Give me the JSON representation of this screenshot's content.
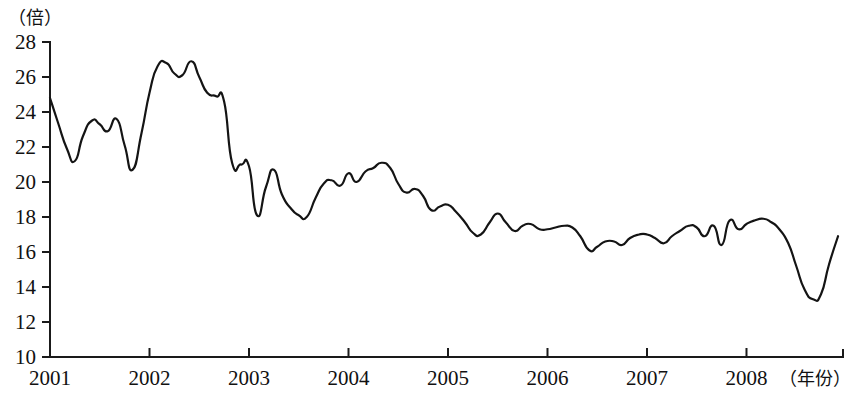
{
  "chart_data": {
    "type": "line",
    "title": "",
    "subtitle": "",
    "xlabel": "（年份）",
    "ylabel": "（倍）",
    "ylim": [
      10,
      28
    ],
    "xlim": [
      2001,
      2008.97
    ],
    "y_ticks": [
      10,
      12,
      14,
      16,
      18,
      20,
      22,
      24,
      26,
      28
    ],
    "x_ticks": [
      2001,
      2002,
      2003,
      2004,
      2005,
      2006,
      2007,
      2008
    ],
    "x_tick_labels": [
      "2001",
      "2002",
      "2003",
      "2004",
      "2005",
      "2006",
      "2007",
      "2008"
    ],
    "y_tick_labels": [
      "10",
      "12",
      "14",
      "16",
      "18",
      "20",
      "22",
      "24",
      "26",
      "28"
    ],
    "grid": false,
    "legend": null,
    "legend_position": "none",
    "line_color": "#141414",
    "series": [
      {
        "name": "市盈率",
        "x": [
          2001.0,
          2001.08,
          2001.17,
          2001.25,
          2001.33,
          2001.42,
          2001.5,
          2001.58,
          2001.67,
          2001.75,
          2001.83,
          2001.92,
          2002.0,
          2002.08,
          2002.17,
          2002.25,
          2002.33,
          2002.42,
          2002.5,
          2002.58,
          2002.67,
          2002.75,
          2002.83,
          2002.92,
          2003.0,
          2003.08,
          2003.17,
          2003.25,
          2003.33,
          2003.42,
          2003.5,
          2003.58,
          2003.67,
          2003.75,
          2003.83,
          2003.92,
          2004.0,
          2004.08,
          2004.17,
          2004.25,
          2004.33,
          2004.42,
          2004.5,
          2004.58,
          2004.67,
          2004.75,
          2004.83,
          2004.92,
          2005.0,
          2005.08,
          2005.17,
          2005.25,
          2005.33,
          2005.42,
          2005.5,
          2005.58,
          2005.67,
          2005.75,
          2005.83,
          2005.92,
          2006.0,
          2006.08,
          2006.17,
          2006.25,
          2006.33,
          2006.42,
          2006.5,
          2006.58,
          2006.67,
          2006.75,
          2006.83,
          2006.92,
          2007.0,
          2007.08,
          2007.17,
          2007.25,
          2007.33,
          2007.42,
          2007.5,
          2007.58,
          2007.67,
          2007.75,
          2007.83,
          2007.92,
          2008.0,
          2008.08,
          2008.17,
          2008.25,
          2008.33,
          2008.42,
          2008.5,
          2008.58,
          2008.67,
          2008.75,
          2008.83,
          2008.92
        ],
        "values": [
          24.8,
          23.4,
          21.9,
          21.2,
          22.6,
          23.5,
          23.3,
          22.9,
          23.6,
          22.1,
          20.7,
          22.8,
          25.1,
          26.6,
          26.8,
          26.2,
          26.1,
          26.9,
          26.0,
          25.1,
          24.9,
          24.6,
          21.1,
          21.0,
          20.9,
          18.1,
          19.7,
          20.7,
          19.3,
          18.5,
          18.1,
          18.0,
          19.1,
          19.9,
          20.1,
          19.8,
          20.5,
          20.0,
          20.6,
          20.8,
          21.1,
          20.8,
          19.9,
          19.4,
          19.6,
          19.2,
          18.4,
          18.6,
          18.7,
          18.3,
          17.7,
          17.1,
          17.0,
          17.7,
          18.2,
          17.7,
          17.2,
          17.5,
          17.6,
          17.3,
          17.3,
          17.4,
          17.5,
          17.4,
          16.9,
          16.1,
          16.3,
          16.6,
          16.6,
          16.4,
          16.8,
          17.0,
          17.0,
          16.8,
          16.5,
          16.9,
          17.2,
          17.5,
          17.4,
          16.9,
          17.5,
          16.4,
          17.8,
          17.3,
          17.6,
          17.8,
          17.9,
          17.7,
          17.3,
          16.5,
          15.2,
          13.9,
          13.3,
          13.6,
          15.3,
          16.9
        ]
      }
    ],
    "annotations": []
  },
  "axes": {
    "y_unit_label": "（倍）",
    "x_unit_label": "（年份）"
  }
}
